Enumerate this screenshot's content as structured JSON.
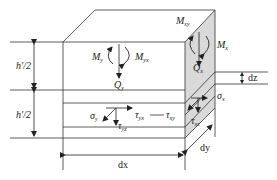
{
  "diagram": {
    "type": "plate-element-stress-diagram",
    "labels": {
      "half_thickness_top": "h'/2",
      "half_thickness_bottom": "h'/2",
      "moment_y": {
        "base": "M",
        "sub": "y"
      },
      "twist_moment_yx": {
        "base": "M",
        "sub": "yx"
      },
      "shear_y": {
        "base": "Q",
        "sub": "y"
      },
      "twist_moment_xy": {
        "base": "M",
        "sub": "xy"
      },
      "moment_x": {
        "base": "M",
        "sub": "x"
      },
      "shear_x": {
        "base": "Q",
        "sub": "x"
      },
      "thickness_increment": "dz",
      "stress_y": {
        "base": "σ",
        "sub": "y"
      },
      "shear_stress_yx": {
        "base": "τ",
        "sub": "yx"
      },
      "shear_stress_yz": {
        "base": "τ",
        "sub": "yz"
      },
      "shear_stress_xy": {
        "base": "τ",
        "sub": "xy"
      },
      "stress_x": {
        "base": "σ",
        "sub": "x"
      },
      "shear_stress_xz": {
        "base": "τ",
        "sub": "xz"
      },
      "width_x": "dx",
      "width_y": "dy"
    },
    "colors": {
      "line": "#333333",
      "shade": "#d9d9d9",
      "background": "#ffffff"
    }
  }
}
